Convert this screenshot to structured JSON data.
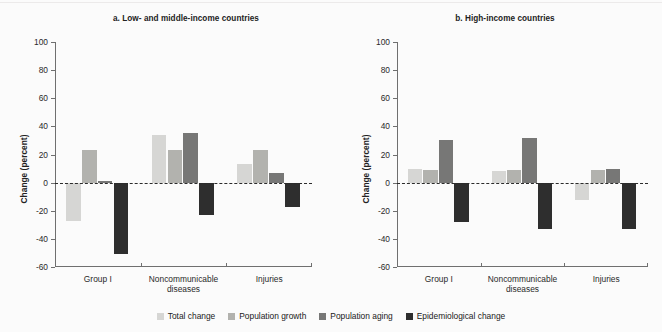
{
  "figure": {
    "background": "#fbfbfb"
  },
  "legend": {
    "position": "bottom-center",
    "items": [
      {
        "label": "Total change",
        "color": "#d6d6d4",
        "key": "total_change"
      },
      {
        "label": "Population growth",
        "color": "#b2b2ae",
        "key": "population_growth"
      },
      {
        "label": "Population aging",
        "color": "#777776",
        "key": "population_aging"
      },
      {
        "label": "Epidemiological change",
        "color": "#2e2e2e",
        "key": "epidemiological_change"
      }
    ]
  },
  "chart_data": [
    {
      "type": "bar",
      "title": "a. Low- and middle-income countries",
      "xlabel": "",
      "ylabel": "Change (percent)",
      "ylim": [
        -60,
        100
      ],
      "yticks": [
        100,
        80,
        60,
        40,
        20,
        0,
        -20,
        -40,
        -60
      ],
      "ytick_labels": [
        "100",
        "80",
        "60",
        "40",
        "20",
        "0",
        "-20",
        "-40",
        "-60"
      ],
      "grid": false,
      "zero_line": true,
      "categories": [
        "Group I",
        "Noncommunicable diseases",
        "Injuries"
      ],
      "category_lines": [
        [
          "Group I"
        ],
        [
          "Noncommunicable",
          "diseases"
        ],
        [
          "Injuries"
        ]
      ],
      "series": [
        {
          "name": "Total change",
          "color": "#d6d6d4",
          "values": [
            -27,
            34,
            13
          ]
        },
        {
          "name": "Population growth",
          "color": "#b2b2ae",
          "values": [
            23,
            23,
            23
          ]
        },
        {
          "name": "Population aging",
          "color": "#777776",
          "values": [
            1,
            35,
            7
          ]
        },
        {
          "name": "Epidemiological change",
          "color": "#2e2e2e",
          "values": [
            -51,
            -23,
            -17
          ]
        }
      ]
    },
    {
      "type": "bar",
      "title": "b. High-income countries",
      "xlabel": "",
      "ylabel": "Change (percent)",
      "ylim": [
        -60,
        100
      ],
      "yticks": [
        100,
        80,
        60,
        40,
        20,
        0,
        -20,
        -40,
        -60
      ],
      "ytick_labels": [
        "100",
        "80",
        "60",
        "40",
        "20",
        "0",
        "-20",
        "-40",
        "-60"
      ],
      "grid": false,
      "zero_line": true,
      "categories": [
        "Group I",
        "Noncommunicable diseases",
        "Injuries"
      ],
      "category_lines": [
        [
          "Group I"
        ],
        [
          "Noncommunicable",
          "diseases"
        ],
        [
          "Injuries"
        ]
      ],
      "series": [
        {
          "name": "Total change",
          "color": "#d6d6d4",
          "values": [
            10,
            8,
            -12
          ]
        },
        {
          "name": "Population growth",
          "color": "#b2b2ae",
          "values": [
            9,
            9,
            9
          ]
        },
        {
          "name": "Population aging",
          "color": "#777776",
          "values": [
            30,
            32,
            10
          ]
        },
        {
          "name": "Epidemiological change",
          "color": "#2e2e2e",
          "values": [
            -28,
            -33,
            -33
          ]
        }
      ]
    }
  ]
}
